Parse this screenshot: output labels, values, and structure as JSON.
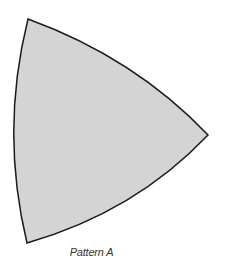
{
  "diagram": {
    "caption": "Pattern A",
    "shape": {
      "type": "curved-triangle",
      "fill": "#d4d4d4",
      "stroke": "#1a1a1a",
      "stroke_width": 1.5,
      "vertices": {
        "top": [
          28,
          19
        ],
        "right": [
          208,
          135
        ],
        "bottom": [
          27,
          243
        ]
      }
    }
  }
}
